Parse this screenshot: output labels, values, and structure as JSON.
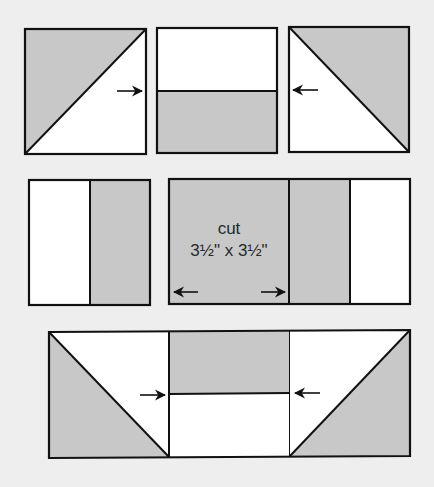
{
  "diagram": {
    "title": "",
    "colors": {
      "background": "#eeeeee",
      "fabric_light": "#ffffff",
      "fabric_dark": "#c8c8c8",
      "outline": "#111111"
    },
    "rows": [
      {
        "name": "top-row",
        "units": [
          {
            "name": "half-square-triangle-left",
            "type": "hst",
            "dark": "upper-left"
          },
          {
            "name": "two-strip-unit-horizontal",
            "type": "strips",
            "top": "light",
            "bottom": "dark"
          },
          {
            "name": "half-square-triangle-right",
            "type": "hst",
            "dark": "upper-right"
          }
        ],
        "pressing_arrows": [
          "right",
          "left"
        ]
      },
      {
        "name": "middle-row",
        "units": [
          {
            "name": "two-strip-unit-vertical",
            "type": "strips",
            "left": "light",
            "right": "dark"
          },
          {
            "name": "cut-square",
            "type": "square",
            "fill": "dark"
          },
          {
            "name": "two-strip-unit-vertical-right",
            "type": "strips",
            "left": "dark",
            "right": "light"
          }
        ],
        "pressing_arrows": [
          "left",
          "right"
        ]
      },
      {
        "name": "bottom-row",
        "units": [
          {
            "name": "half-square-triangle-left",
            "type": "hst",
            "dark": "lower-left"
          },
          {
            "name": "two-strip-unit-horizontal",
            "type": "strips",
            "top": "dark",
            "bottom": "light"
          },
          {
            "name": "half-square-triangle-right",
            "type": "hst",
            "dark": "lower-right"
          }
        ],
        "pressing_arrows": [
          "right",
          "left"
        ]
      }
    ],
    "labels": {
      "cut_line1": "cut",
      "cut_line2": "3½\" x 3½\""
    }
  }
}
